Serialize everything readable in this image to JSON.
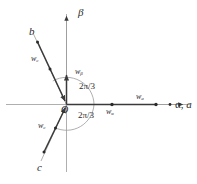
{
  "figure": {
    "type": "vector-diagram",
    "background_color": "#ffffff",
    "line_color": "#3a3a3a",
    "text_color": "#2b2b2b",
    "width": 197,
    "height": 184
  },
  "axes": {
    "beta": {
      "label": "β",
      "name": "beta-axis",
      "orientation": "vertical",
      "arrow": "up"
    },
    "alpha": {
      "label": "α, ",
      "label_second": "a",
      "label_full": "α, a",
      "name": "alpha-a-axis",
      "orientation": "horizontal",
      "arrow": "right",
      "angle_deg": 0
    },
    "b": {
      "label": "b",
      "name": "b-axis",
      "angle_deg": 120,
      "arrow": "toward-origin"
    },
    "c": {
      "label": "c",
      "name": "c-axis",
      "angle_deg": 240,
      "arrow": "toward-origin"
    }
  },
  "origin": {
    "label": "O"
  },
  "vectors": [
    {
      "id": "w_alpha",
      "base": "w",
      "sub": "α",
      "label": "wα",
      "position": "below-horizontal-axis"
    },
    {
      "id": "w_a",
      "base": "w",
      "sub": "a",
      "label": "wa",
      "position": "above-horizontal-axis"
    },
    {
      "id": "w_beta",
      "base": "w",
      "sub": "β",
      "label": "wβ",
      "position": "right-of-vertical-axis"
    },
    {
      "id": "w_b",
      "base": "w",
      "sub": "b",
      "label": "wb",
      "position": "along-b-axis"
    },
    {
      "id": "w_c",
      "base": "w",
      "sub": "c",
      "label": "wc",
      "position": "along-c-axis"
    }
  ],
  "angles": [
    {
      "id": "angle-upper",
      "label": "2π/3",
      "from": "a-axis",
      "to": "b-axis",
      "value_rad": "2π/3"
    },
    {
      "id": "angle-lower",
      "label": "2π/3",
      "from": "a-axis",
      "to": "c-axis",
      "value_rad": "2π/3"
    }
  ]
}
